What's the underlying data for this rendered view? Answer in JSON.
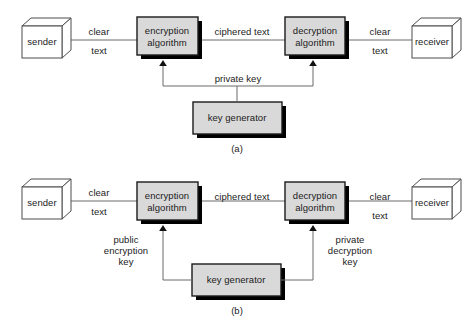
{
  "figure": {
    "panels": [
      {
        "id": "a",
        "label": "(a)",
        "nodes": {
          "sender": "sender",
          "encryption": "encryption\nalgorithm",
          "encryption_line1": "encryption",
          "encryption_line2": "algorithm",
          "decryption": "decryption\nalgorithm",
          "decryption_line1": "decryption",
          "decryption_line2": "algorithm",
          "receiver": "receiver",
          "key_generator": "key generator"
        },
        "edges": {
          "sender_to_encryption_line1": "clear",
          "sender_to_encryption_line2": "text",
          "encryption_to_decryption": "ciphered text",
          "decryption_to_receiver_line1": "clear",
          "decryption_to_receiver_line2": "text",
          "key_to_both": "private key"
        }
      },
      {
        "id": "b",
        "label": "(b)",
        "nodes": {
          "sender": "sender",
          "encryption_line1": "encryption",
          "encryption_line2": "algorithm",
          "decryption_line1": "decryption",
          "decryption_line2": "algorithm",
          "receiver": "receiver",
          "key_generator": "key generator"
        },
        "edges": {
          "sender_to_encryption_line1": "clear",
          "sender_to_encryption_line2": "text",
          "encryption_to_decryption": "ciphered text",
          "decryption_to_receiver_line1": "clear",
          "decryption_to_receiver_line2": "text",
          "key_to_encryption_line1": "public",
          "key_to_encryption_line2": "encryption",
          "key_to_encryption_line3": "key",
          "key_to_decryption_line1": "private",
          "key_to_decryption_line2": "decryption",
          "key_to_decryption_line3": "key"
        }
      }
    ]
  },
  "colors": {
    "background": "#ffffff",
    "box_fill": "#d9d9d9",
    "cube_fill": "#ffffff",
    "stroke": "#4d4d4d",
    "box_stroke": "#1a1a1a",
    "shadow": "#000000",
    "text": "#1b1b1b",
    "connector": "#6b6b6b"
  }
}
